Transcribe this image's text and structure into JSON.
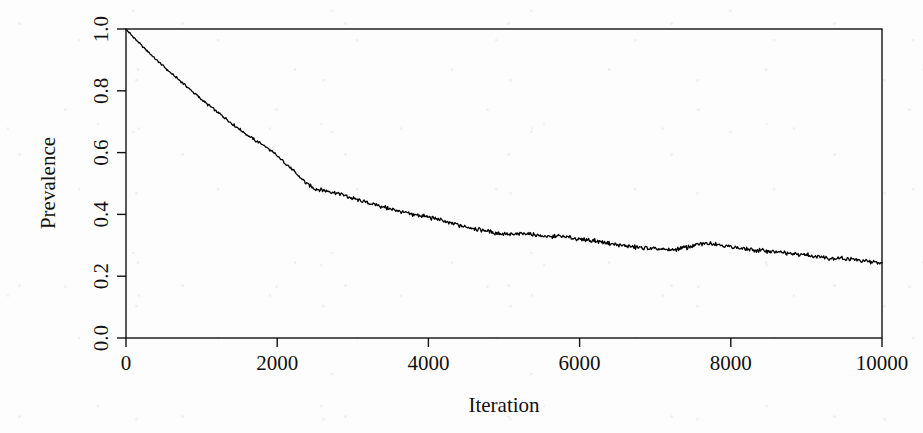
{
  "chart_data": {
    "type": "line",
    "title": "",
    "subtitle": "",
    "xlabel": "Iteration",
    "ylabel": "Prevalence",
    "xlim": [
      0,
      10000
    ],
    "ylim": [
      0.0,
      1.0
    ],
    "xticks": [
      0,
      2000,
      4000,
      6000,
      8000,
      10000
    ],
    "xticklabels": [
      "0",
      "2000",
      "4000",
      "6000",
      "8000",
      "10000"
    ],
    "yticks": [
      0.0,
      0.2,
      0.4,
      0.6,
      0.8,
      1.0
    ],
    "yticklabels": [
      "0.0",
      "0.2",
      "0.4",
      "0.6",
      "0.8",
      "1.0"
    ],
    "grid": false,
    "legend": false,
    "legend_position": "none",
    "line_color": "#000000",
    "line_width": 1.3,
    "frame_box": true,
    "series": [
      {
        "name": "Prevalence",
        "x": [
          0,
          100,
          200,
          300,
          400,
          500,
          600,
          700,
          800,
          900,
          1000,
          1100,
          1200,
          1300,
          1400,
          1500,
          1600,
          1700,
          1800,
          1900,
          2000,
          2100,
          2200,
          2300,
          2400,
          2500,
          2600,
          2700,
          2800,
          2900,
          3000,
          3100,
          3200,
          3300,
          3400,
          3500,
          3600,
          3700,
          3800,
          3900,
          4000,
          4100,
          4200,
          4300,
          4400,
          4500,
          4600,
          4700,
          4800,
          4900,
          5000,
          5100,
          5200,
          5300,
          5400,
          5500,
          5600,
          5700,
          5800,
          5900,
          6000,
          6100,
          6200,
          6300,
          6400,
          6500,
          6600,
          6700,
          6800,
          6900,
          7000,
          7100,
          7200,
          7300,
          7400,
          7500,
          7600,
          7700,
          7800,
          7900,
          8000,
          8100,
          8200,
          8300,
          8400,
          8500,
          8600,
          8700,
          8800,
          8900,
          9000,
          9100,
          9200,
          9300,
          9400,
          9500,
          9600,
          9700,
          9800,
          9900,
          10000
        ],
        "y": [
          1.0,
          0.973,
          0.948,
          0.925,
          0.901,
          0.878,
          0.856,
          0.836,
          0.815,
          0.793,
          0.772,
          0.752,
          0.733,
          0.714,
          0.694,
          0.676,
          0.658,
          0.641,
          0.628,
          0.61,
          0.589,
          0.568,
          0.545,
          0.521,
          0.498,
          0.484,
          0.478,
          0.474,
          0.468,
          0.461,
          0.452,
          0.444,
          0.437,
          0.431,
          0.424,
          0.417,
          0.411,
          0.404,
          0.4,
          0.396,
          0.391,
          0.385,
          0.378,
          0.371,
          0.365,
          0.36,
          0.355,
          0.35,
          0.344,
          0.34,
          0.337,
          0.333,
          0.336,
          0.34,
          0.335,
          0.33,
          0.327,
          0.33,
          0.328,
          0.323,
          0.32,
          0.317,
          0.314,
          0.31,
          0.307,
          0.301,
          0.298,
          0.295,
          0.292,
          0.291,
          0.288,
          0.286,
          0.285,
          0.288,
          0.292,
          0.298,
          0.303,
          0.307,
          0.305,
          0.3,
          0.296,
          0.291,
          0.288,
          0.285,
          0.283,
          0.281,
          0.279,
          0.276,
          0.273,
          0.271,
          0.27,
          0.265,
          0.262,
          0.259,
          0.258,
          0.257,
          0.254,
          0.251,
          0.248,
          0.245,
          0.243
        ]
      }
    ]
  }
}
